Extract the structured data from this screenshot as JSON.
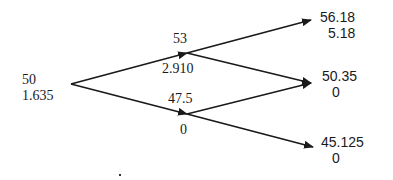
{
  "diagram": {
    "type": "binomial-tree",
    "colors": {
      "line": "#1a1a1a",
      "text": "#1a1a1a",
      "background": "#ffffff"
    },
    "nodes": {
      "root": {
        "price": "50",
        "value": "1.635"
      },
      "up": {
        "price": "53",
        "value": "2.910"
      },
      "down": {
        "price": "47.5",
        "value": "0"
      },
      "up_up": {
        "price": "56.18",
        "value": "5.18"
      },
      "up_down": {
        "price": "50.35",
        "value": "0"
      },
      "down_down": {
        "price": "45.125",
        "value": "0"
      }
    },
    "edges": [
      {
        "from": "root",
        "to": "up"
      },
      {
        "from": "root",
        "to": "down"
      },
      {
        "from": "up",
        "to": "up_up"
      },
      {
        "from": "up",
        "to": "up_down"
      },
      {
        "from": "down",
        "to": "up_down"
      },
      {
        "from": "down",
        "to": "down_down"
      }
    ]
  }
}
